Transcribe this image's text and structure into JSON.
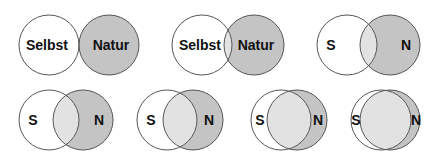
{
  "figure": {
    "colors": {
      "self_fill": "#ffffff",
      "nature_fill": "#c4c4c4",
      "overlap_fill": "#e2e2e2",
      "stroke": "#555555"
    },
    "panels": [
      {
        "id": 1,
        "self_label": "Selbst",
        "nature_label": "Natur",
        "self_cx": 49,
        "nature_cx": 109,
        "cy": 45,
        "r": 30,
        "label_size": 14
      },
      {
        "id": 2,
        "self_label": "Selbst",
        "nature_label": "Natur",
        "self_cx": 202,
        "nature_cx": 254,
        "cy": 45,
        "r": 30,
        "label_size": 14
      },
      {
        "id": 3,
        "self_label": "S",
        "nature_label": "N",
        "self_cx": 347,
        "nature_cx": 390,
        "cy": 45,
        "r": 30,
        "label_size": 14
      },
      {
        "id": 4,
        "self_label": "S",
        "nature_label": "N",
        "self_cx": 49,
        "nature_cx": 83,
        "cy": 120,
        "r": 30,
        "label_size": 14
      },
      {
        "id": 5,
        "self_label": "S",
        "nature_label": "N",
        "self_cx": 167,
        "nature_cx": 193,
        "cy": 120,
        "r": 30,
        "label_size": 14
      },
      {
        "id": 6,
        "self_label": "S",
        "nature_label": "N",
        "self_cx": 281,
        "nature_cx": 297,
        "cy": 120,
        "r": 30,
        "label_size": 14
      },
      {
        "id": 7,
        "self_label": "S",
        "nature_label": "N",
        "self_cx": 381,
        "nature_cx": 390,
        "cy": 120,
        "r": 30,
        "label_size": 14
      }
    ]
  }
}
